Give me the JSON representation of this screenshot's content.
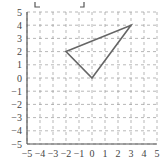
{
  "chart_data": {
    "type": "line",
    "title": "",
    "xlabel": "",
    "ylabel": "",
    "xlim": [
      -5,
      5
    ],
    "ylim": [
      -5,
      5
    ],
    "grid": true,
    "grid_style": "dashed",
    "x_ticks": [
      "−5",
      "−4",
      "−3",
      "−2",
      "−1",
      "0",
      "1",
      "2",
      "3",
      "4",
      "5"
    ],
    "y_ticks": [
      "5",
      "4",
      "3",
      "2",
      "1",
      "0",
      "−1",
      "−2",
      "−3",
      "−4",
      "−5"
    ],
    "series": [
      {
        "name": "triangle",
        "closed": true,
        "points": [
          [
            -2,
            2
          ],
          [
            3,
            4
          ],
          [
            0,
            0
          ]
        ]
      }
    ],
    "colors": {
      "shape": "#666666",
      "grid": "#999999",
      "axis": "#555555"
    }
  }
}
